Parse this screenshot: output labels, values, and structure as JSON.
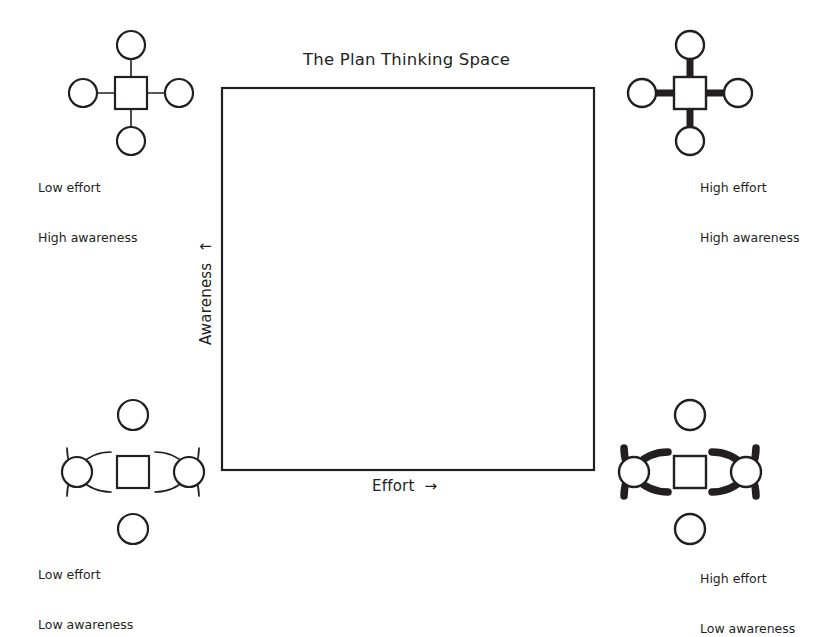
{
  "diagram": {
    "title": "The Plan Thinking Space",
    "axes": {
      "x_label": "Effort",
      "x_arrow": "→",
      "y_label": "Awareness",
      "y_arrow": "↑"
    },
    "plot_area": {
      "left": 222,
      "top": 88,
      "right": 594,
      "bottom": 470,
      "border_color": "#231f20",
      "fill_color": "#ffffff"
    },
    "quadrants": [
      {
        "id": "top-left",
        "position": "top-left",
        "line1": "Low effort",
        "line2": "High awareness",
        "effort": "low",
        "awareness": "high",
        "icon": "drone-straight-arms-thin-icon",
        "stroke_weight": 1.4,
        "arms": "straight",
        "center_x": 131,
        "center_y": 93
      },
      {
        "id": "top-right",
        "position": "top-right",
        "line1": "High effort",
        "line2": "High awareness",
        "effort": "high",
        "awareness": "high",
        "icon": "drone-straight-arms-thick-icon",
        "stroke_weight": 6.5,
        "arms": "straight",
        "center_x": 690,
        "center_y": 93
      },
      {
        "id": "bottom-left",
        "position": "bottom-left",
        "line1": "Low effort",
        "line2": "Low awareness",
        "effort": "low",
        "awareness": "low",
        "icon": "drone-curved-arcs-thin-icon",
        "stroke_weight": 1.4,
        "arms": "curved",
        "center_x": 133,
        "center_y": 472
      },
      {
        "id": "bottom-right",
        "position": "bottom-right",
        "line1": "High effort",
        "line2": "Low awareness",
        "effort": "high",
        "awareness": "low",
        "icon": "drone-curved-arcs-thick-icon",
        "stroke_weight": 7,
        "arms": "curved",
        "center_x": 690,
        "center_y": 472
      }
    ],
    "colors": {
      "ink": "#231f20",
      "background": "#ffffff"
    }
  }
}
